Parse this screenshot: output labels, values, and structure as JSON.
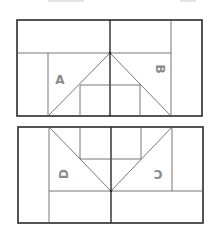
{
  "diagram": {
    "panels": [
      {
        "id": "top-panel",
        "labels": [
          {
            "text": "A",
            "rotation": 0
          },
          {
            "text": "B",
            "rotation": 90
          }
        ]
      },
      {
        "id": "bottom-panel",
        "labels": [
          {
            "text": "D",
            "rotation": -90
          },
          {
            "text": "C",
            "rotation": 180
          }
        ]
      }
    ],
    "colors": {
      "line": "#2a2a2a",
      "label": "#8a8a8a",
      "background": "#ffffff"
    }
  }
}
